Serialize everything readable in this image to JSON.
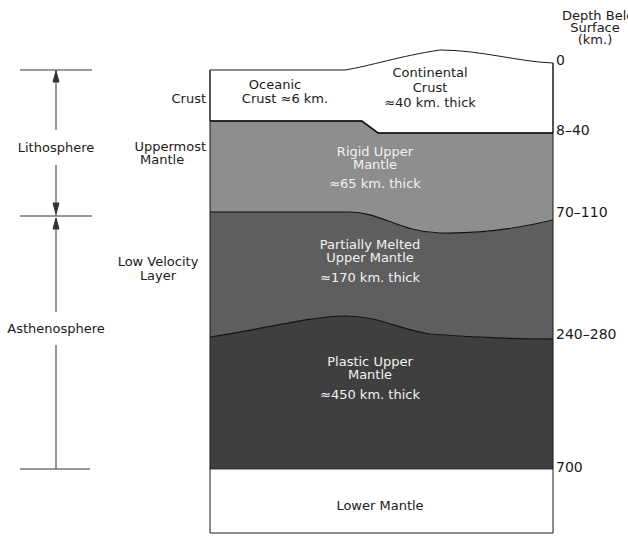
{
  "diagram": {
    "type": "earth-layer-cross-section",
    "depth_axis": {
      "title_lines": [
        "Depth Below",
        "Surface",
        "(km.)"
      ],
      "ticks": [
        "0",
        "8–40",
        "70–110",
        "240–280",
        "700"
      ]
    },
    "brackets": {
      "lithosphere": "Lithosphere",
      "asthenosphere": "Asthenosphere"
    },
    "side_labels": {
      "crust": "Crust",
      "uppermost_mantle_1": "Uppermost",
      "uppermost_mantle_2": "Mantle",
      "low_velocity_1": "Low Velocity",
      "low_velocity_2": "Layer"
    },
    "layers": {
      "oceanic_crust": {
        "line1": "Oceanic",
        "line2": "Crust  ≈6 km."
      },
      "continental_crust": {
        "line1": "Continental",
        "line2": "Crust",
        "line3": "≈40 km. thick"
      },
      "rigid_upper_mantle": {
        "line1": "Rigid Upper",
        "line2": "Mantle",
        "line3": "≈65 km. thick"
      },
      "partially_melted": {
        "line1": "Partially  Melted",
        "line2": "Upper Mantle",
        "line3": "≈170 km. thick"
      },
      "plastic_upper_mantle": {
        "line1": "Plastic Upper",
        "line2": "Mantle",
        "line3": "≈450 km. thick"
      },
      "lower_mantle": {
        "line1": "Lower Mantle"
      }
    },
    "colors": {
      "crust": "#ffffff",
      "rigid_upper_mantle": "#8e8e8e",
      "partially_melted": "#5e5e5e",
      "plastic_upper_mantle": "#3f3f3f",
      "lower_mantle": "#ffffff",
      "lines": "#1a1a1a"
    }
  }
}
